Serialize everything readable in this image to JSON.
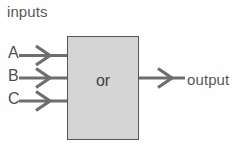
{
  "diagram": {
    "title_label": "inputs",
    "gate": {
      "type_label": "or",
      "fill_color": "#d5d5d5",
      "border_color": "#555557"
    },
    "inputs": [
      {
        "label": "A",
        "wire_name": "input-wire-a"
      },
      {
        "label": "B",
        "wire_name": "input-wire-b"
      },
      {
        "label": "C",
        "wire_name": "input-wire-c"
      }
    ],
    "output": {
      "label": "output",
      "wire_name": "output-wire"
    },
    "colors": {
      "background": "#ffffff",
      "wire": "#6e6e70",
      "text": "#58585a"
    }
  }
}
